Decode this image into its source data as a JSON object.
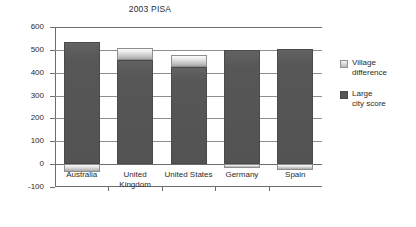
{
  "chart_data": {
    "type": "bar",
    "title": "2003 PISA",
    "xlabel": "",
    "ylabel": "",
    "ylim": [
      -100,
      600
    ],
    "ytick_labels": [
      "600",
      "500",
      "400",
      "300",
      "200",
      "100",
      "0",
      "-100"
    ],
    "ytick_values": [
      600,
      500,
      400,
      300,
      200,
      100,
      0,
      -100
    ],
    "grid": true,
    "stacked": true,
    "legend_position": "right",
    "categories": [
      "Australia",
      "United\nKingdom",
      "United States",
      "Germany",
      "Spain"
    ],
    "series": [
      {
        "name": "Large city score",
        "color": "#565656",
        "values": [
          535,
          455,
          425,
          500,
          503
        ]
      },
      {
        "name": "Village difference",
        "color": "#d8d8d8",
        "values": [
          -35,
          53,
          53,
          -15,
          -25
        ]
      }
    ],
    "bars": [
      {
        "category": "Australia",
        "dark_top": 535,
        "dark_bottom": 0,
        "light_top": 0,
        "light_bottom": -35
      },
      {
        "category": "United Kingdom",
        "dark_top": 455,
        "dark_bottom": 0,
        "light_top": 508,
        "light_bottom": 455
      },
      {
        "category": "United States",
        "dark_top": 425,
        "dark_bottom": 0,
        "light_top": 478,
        "light_bottom": 425
      },
      {
        "category": "Germany",
        "dark_top": 500,
        "dark_bottom": 0,
        "light_top": 0,
        "light_bottom": -15
      },
      {
        "category": "Spain",
        "dark_top": 503,
        "dark_bottom": 0,
        "light_top": 0,
        "light_bottom": -25
      }
    ]
  },
  "legend": {
    "items": [
      {
        "label": "Village\ndifference",
        "swatch": "light"
      },
      {
        "label": "Large\ncity score",
        "swatch": "dark"
      }
    ]
  }
}
